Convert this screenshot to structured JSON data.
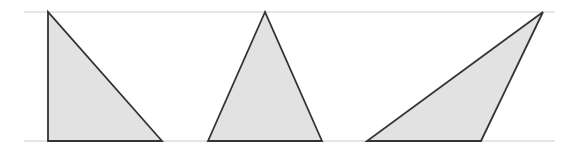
{
  "diagram": {
    "fill_color": "#e2e2e2",
    "stroke_color": "#333333",
    "guide_line_color": "#cccccc",
    "guide_lines": [
      {
        "name": "top-parallel-line",
        "x1": 24,
        "y1": 12,
        "x2": 555,
        "y2": 12
      },
      {
        "name": "bottom-parallel-line",
        "x1": 24,
        "y1": 141,
        "x2": 555,
        "y2": 141
      }
    ],
    "triangles": [
      {
        "name": "right-triangle",
        "points": "48,12 48,141 162,141"
      },
      {
        "name": "isosceles-triangle",
        "points": "265,12 208,141 322,141"
      },
      {
        "name": "obtuse-triangle",
        "points": "543,12 367,141 481,141"
      }
    ]
  }
}
